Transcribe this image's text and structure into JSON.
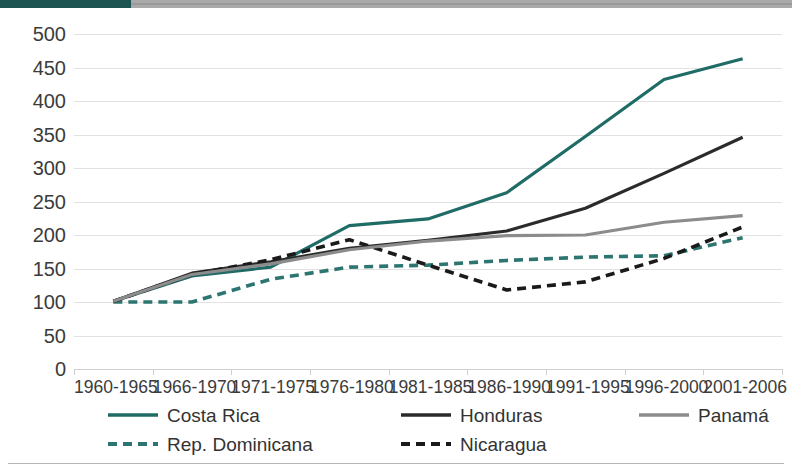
{
  "header": {
    "accent_color": "#1d5452",
    "rule_color": "#9a9a9a"
  },
  "chart_data": {
    "type": "line",
    "title": "",
    "subtitle": "",
    "xlabel": "",
    "ylabel": "",
    "categories": [
      "1960-1965",
      "1966-1970",
      "1971-1975",
      "1976-1980",
      "1981-1985",
      "1986-1990",
      "1991-1995",
      "1996-2000",
      "2001-2006"
    ],
    "ylim": [
      0,
      500
    ],
    "ytick_step": 50,
    "yticks": [
      500,
      450,
      400,
      350,
      300,
      250,
      200,
      150,
      100,
      50,
      0
    ],
    "grid": true,
    "legend_position": "bottom",
    "series": [
      {
        "name": "Costa Rica",
        "color": "#1f6b66",
        "style": "solid",
        "values": [
          101,
          139,
          152,
          214,
          224,
          263,
          347,
          432,
          463
        ]
      },
      {
        "name": "Rep. Dominicana",
        "color": "#2d7570",
        "style": "dashed",
        "values": [
          100,
          100,
          134,
          152,
          155,
          162,
          167,
          169,
          196
        ]
      },
      {
        "name": "Honduras",
        "color": "#2b2b2b",
        "style": "solid",
        "values": [
          101,
          143,
          160,
          180,
          192,
          206,
          240,
          292,
          346
        ]
      },
      {
        "name": "Nicaragua",
        "color": "#1a1a1a",
        "style": "dashed",
        "values": [
          101,
          141,
          163,
          193,
          155,
          118,
          130,
          165,
          212
        ]
      },
      {
        "name": "Panamá",
        "color": "#8c8c8c",
        "style": "solid",
        "values": [
          101,
          141,
          157,
          178,
          191,
          199,
          200,
          219,
          229
        ]
      }
    ]
  },
  "legend": {
    "items": [
      {
        "label": "Costa Rica",
        "color": "#1f6b66",
        "style": "solid",
        "col": 0,
        "row": 0
      },
      {
        "label": "Honduras",
        "color": "#2b2b2b",
        "style": "solid",
        "col": 1,
        "row": 0
      },
      {
        "label": "Panamá",
        "color": "#8c8c8c",
        "style": "solid",
        "col": 2,
        "row": 0
      },
      {
        "label": "Rep. Dominicana",
        "color": "#2d7570",
        "style": "dashed",
        "col": 0,
        "row": 1
      },
      {
        "label": "Nicaragua",
        "color": "#1a1a1a",
        "style": "dashed",
        "col": 1,
        "row": 1
      }
    ]
  }
}
